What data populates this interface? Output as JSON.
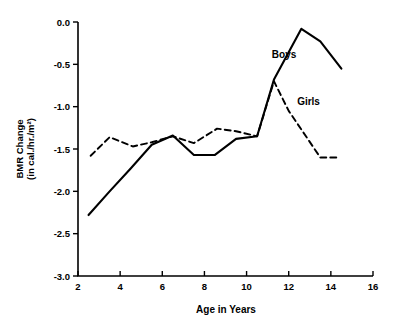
{
  "chart_data": {
    "type": "line",
    "title": "",
    "xlabel": "Age in Years",
    "ylabel": "BMR Change (in cal./hr./m²)",
    "ylabel_line1": "BMR Change",
    "ylabel_line2": "(in cal./hr./m²)",
    "xlim": [
      2,
      16
    ],
    "ylim": [
      -3.0,
      0.0
    ],
    "xticks": [
      2,
      4,
      6,
      8,
      10,
      12,
      14,
      16
    ],
    "xtick_labels": [
      "2",
      "4",
      "6",
      "8",
      "10",
      "12",
      "14",
      "16"
    ],
    "yticks": [
      0.0,
      -0.5,
      -1.0,
      -1.5,
      -2.0,
      -2.5,
      -3.0
    ],
    "ytick_labels": [
      "0.0",
      "-0.5",
      "-1.0",
      "-1.5",
      "-2.0",
      "-2.5",
      "-3.0"
    ],
    "grid": false,
    "legend_position": "inline-annotation",
    "series": [
      {
        "name": "Boys",
        "style": "solid",
        "color": "#000000",
        "label_x": 11.2,
        "label_y": -0.42,
        "x": [
          2.5,
          3.5,
          4.5,
          5.5,
          6.5,
          7.5,
          8.5,
          9.5,
          10.5,
          11.3,
          12.6,
          13.5,
          14.5
        ],
        "values": [
          -2.28,
          -2.0,
          -1.73,
          -1.45,
          -1.34,
          -1.57,
          -1.57,
          -1.38,
          -1.35,
          -0.68,
          -0.08,
          -0.23,
          -0.55
        ]
      },
      {
        "name": "Girls",
        "style": "dashed",
        "color": "#000000",
        "label_x": 12.4,
        "label_y": -0.98,
        "x": [
          2.6,
          3.5,
          4.6,
          5.5,
          6.5,
          7.5,
          8.6,
          9.5,
          10.5,
          11.3,
          12.0,
          13.5,
          14.4
        ],
        "values": [
          -1.58,
          -1.36,
          -1.47,
          -1.42,
          -1.35,
          -1.43,
          -1.26,
          -1.29,
          -1.35,
          -0.7,
          -1.05,
          -1.6,
          -1.6
        ]
      }
    ]
  }
}
